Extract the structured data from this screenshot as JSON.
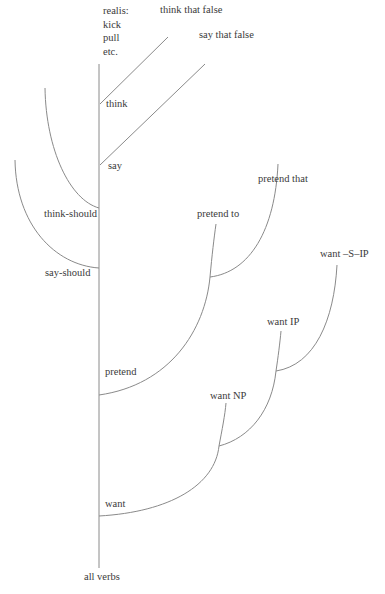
{
  "diagram": {
    "type": "verb-class tree",
    "root": {
      "label": "all verbs"
    },
    "top": {
      "label": "realis:\nkick\npull\netc."
    },
    "nodes": {
      "think": {
        "label": "think"
      },
      "think_that_false": {
        "label": "think that false"
      },
      "say": {
        "label": "say"
      },
      "say_that_false": {
        "label": "say that false"
      },
      "think_should": {
        "label": "think-should"
      },
      "say_should": {
        "label": "say-should"
      },
      "pretend": {
        "label": "pretend"
      },
      "pretend_to": {
        "label": "pretend to"
      },
      "pretend_that": {
        "label": "pretend that"
      },
      "want": {
        "label": "want"
      },
      "want_np": {
        "label": "want NP"
      },
      "want_ip": {
        "label": "want IP"
      },
      "want_s_ip": {
        "label": "want –S–IP"
      }
    },
    "colors": {
      "line": "#8a8a8a",
      "text": "#3a3a3a",
      "background": "#ffffff"
    }
  }
}
